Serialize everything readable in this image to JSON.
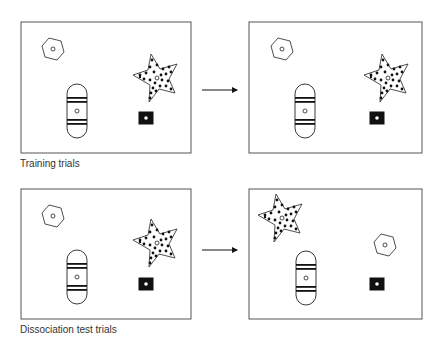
{
  "rows": [
    {
      "caption": "Training trials",
      "panels": [
        {
          "name": "before",
          "objects": {
            "hexagon": {
              "x": 53,
              "y": 49
            },
            "star": {
              "x": 156,
              "y": 78
            },
            "capsule": {
              "x": 77,
              "y": 111
            },
            "square": {
              "x": 146,
              "y": 118
            }
          }
        },
        {
          "name": "after",
          "objects": {
            "hexagon": {
              "x": 282,
              "y": 49
            },
            "star": {
              "x": 387,
              "y": 78
            },
            "capsule": {
              "x": 305,
              "y": 111
            },
            "square": {
              "x": 377,
              "y": 118
            }
          }
        }
      ]
    },
    {
      "caption": "Dissociation test trials",
      "panels": [
        {
          "name": "before",
          "objects": {
            "hexagon": {
              "x": 53,
              "y": 216
            },
            "star": {
              "x": 156,
              "y": 243
            },
            "capsule": {
              "x": 77,
              "y": 277
            },
            "square": {
              "x": 146,
              "y": 284
            }
          }
        },
        {
          "name": "after",
          "objects": {
            "hexagon": {
              "x": 385,
              "y": 245
            },
            "star": {
              "x": 281,
              "y": 218
            },
            "capsule": {
              "x": 306,
              "y": 278
            },
            "square": {
              "x": 377,
              "y": 284
            }
          }
        }
      ]
    }
  ],
  "colors": {
    "line": "#111111",
    "frame": "#555555",
    "text": "#333333"
  }
}
